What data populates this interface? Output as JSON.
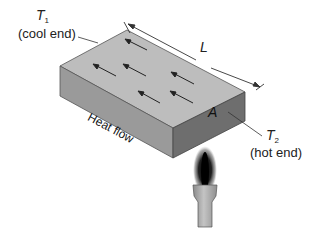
{
  "figure": {
    "type": "heat conduction through a slab",
    "labels": {
      "t1_symbol": "T",
      "t1_subscript": "1",
      "t1_desc": "(cool end)",
      "length_symbol": "L",
      "area_symbol": "A",
      "t2_symbol": "T",
      "t2_subscript": "2",
      "t2_desc": "(hot end)",
      "heat_flow": "Heat flow"
    },
    "colors": {
      "top_face": "#bdbdbd",
      "left_face": "#9a9a9a",
      "right_face": "#6e6e6e",
      "edge": "#444444",
      "arrow": "#222222",
      "flame": "#111111",
      "burner": "#a8a8a8"
    },
    "arrow_count": 7
  }
}
